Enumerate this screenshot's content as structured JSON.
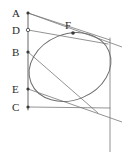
{
  "figure": {
    "type": "geometry-diagram",
    "width": 122,
    "height": 152,
    "background_color": "#ffffff",
    "stroke_color": "#777777",
    "conic_color": "#6e6e6e",
    "label_color": "#2b2b2b",
    "points": [
      {
        "id": "A",
        "label": "A",
        "x": 28,
        "y": 13,
        "label_x": 12,
        "label_y": 17,
        "marker": "filled"
      },
      {
        "id": "D",
        "label": "D",
        "x": 28,
        "y": 30,
        "label_x": 12,
        "label_y": 34,
        "marker": "open"
      },
      {
        "id": "B",
        "label": "B",
        "x": 28,
        "y": 52,
        "label_x": 12,
        "label_y": 56,
        "marker": "filled"
      },
      {
        "id": "E",
        "label": "E",
        "x": 28,
        "y": 89,
        "label_x": 12,
        "label_y": 93,
        "marker": "filled"
      },
      {
        "id": "C",
        "label": "C",
        "x": 28,
        "y": 107,
        "label_x": 12,
        "label_y": 111,
        "marker": "filled"
      },
      {
        "id": "F",
        "label": "F",
        "x": 73,
        "y": 33,
        "label_x": 65,
        "label_y": 27,
        "marker": "filled"
      }
    ],
    "segments": [
      {
        "id": "left-vertical-ADBEC",
        "x1": 28,
        "y1": 12,
        "x2": 28,
        "y2": 110
      },
      {
        "id": "right-vertical",
        "x1": 110,
        "y1": 38,
        "x2": 110,
        "y2": 152
      },
      {
        "id": "tangent-A-upper",
        "x1": 28,
        "y1": 13,
        "x2": 122,
        "y2": 47
      },
      {
        "id": "tangent-A-to-F",
        "x1": 28,
        "y1": 13,
        "x2": 110,
        "y2": 40
      },
      {
        "id": "tangent-D-to-F",
        "x1": 28,
        "y1": 30,
        "x2": 108,
        "y2": 44
      },
      {
        "id": "tangent-E-right",
        "x1": 28,
        "y1": 89,
        "x2": 122,
        "y2": 122
      },
      {
        "id": "chord-C-lower",
        "x1": 28,
        "y1": 107,
        "x2": 110,
        "y2": 108
      },
      {
        "id": "tangent-B-lower",
        "x1": 28,
        "y1": 52,
        "x2": 98,
        "y2": 113
      }
    ],
    "conic": {
      "id": "inscribed-ellipse",
      "center_x": 70,
      "center_y": 67,
      "radius_x": 42,
      "radius_y": 33,
      "rotation_deg": -22
    }
  }
}
